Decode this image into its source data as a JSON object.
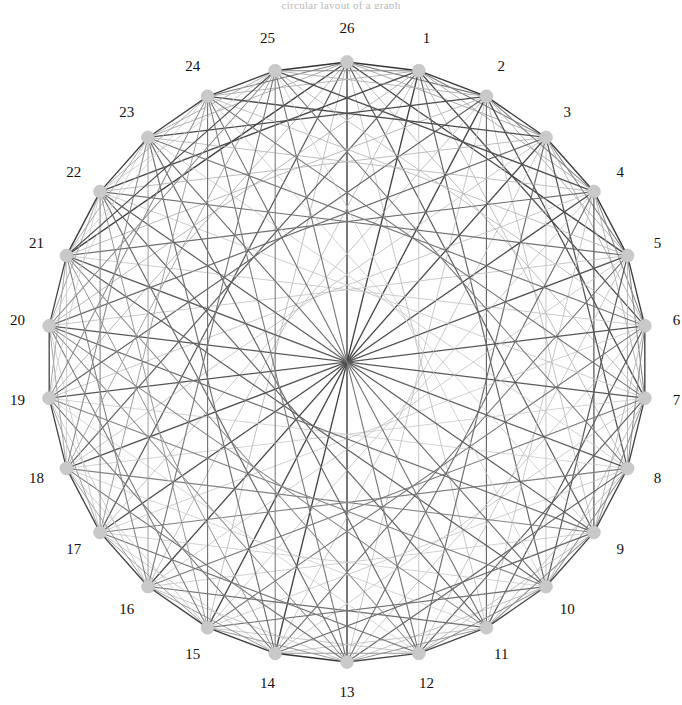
{
  "figure": {
    "type": "circular-graph",
    "title_strip": "circular layout of a graph",
    "background_color": "#ffffff",
    "node_count": 26,
    "center_x": 347,
    "center_y": 362,
    "radius": 300,
    "label_radius": 332,
    "start_angle_deg": -90,
    "direction": "clockwise",
    "node_marker": {
      "shape": "circle",
      "radius": 6.5,
      "fill": "#c9c9c9",
      "stroke": "#bdbdbd"
    },
    "label_style": {
      "font_size": 15,
      "color": "#111111"
    }
  },
  "chart_data": {
    "type": "graph",
    "title": "",
    "xlabel": "",
    "ylabel": "",
    "layout": "circular",
    "grid": false,
    "legend": "none",
    "nodes": [
      {
        "id": 1,
        "label": "1"
      },
      {
        "id": 2,
        "label": "2"
      },
      {
        "id": 3,
        "label": "3"
      },
      {
        "id": 4,
        "label": "4"
      },
      {
        "id": 5,
        "label": "5"
      },
      {
        "id": 6,
        "label": "6"
      },
      {
        "id": 7,
        "label": "7"
      },
      {
        "id": 8,
        "label": "8"
      },
      {
        "id": 9,
        "label": "9"
      },
      {
        "id": 10,
        "label": "10"
      },
      {
        "id": 11,
        "label": "11"
      },
      {
        "id": 12,
        "label": "12"
      },
      {
        "id": 13,
        "label": "13"
      },
      {
        "id": 14,
        "label": "14"
      },
      {
        "id": 15,
        "label": "15"
      },
      {
        "id": 16,
        "label": "16"
      },
      {
        "id": 17,
        "label": "17"
      },
      {
        "id": 18,
        "label": "18"
      },
      {
        "id": 19,
        "label": "19"
      },
      {
        "id": 20,
        "label": "20"
      },
      {
        "id": 21,
        "label": "21"
      },
      {
        "id": 22,
        "label": "22"
      },
      {
        "id": 23,
        "label": "23"
      },
      {
        "id": 24,
        "label": "24"
      },
      {
        "id": 25,
        "label": "25"
      },
      {
        "id": 26,
        "label": "26"
      }
    ],
    "edge_color_dark": "#2b2b2b",
    "edge_color_light": "#d8d8d8",
    "edge_weight_range": [
      0.08,
      1.0
    ],
    "edges": [
      {
        "s": 26,
        "t": 1,
        "w": 0.95
      },
      {
        "s": 26,
        "t": 2,
        "w": 0.55
      },
      {
        "s": 26,
        "t": 3,
        "w": 0.3
      },
      {
        "s": 26,
        "t": 5,
        "w": 0.85
      },
      {
        "s": 26,
        "t": 7,
        "w": 0.22
      },
      {
        "s": 26,
        "t": 9,
        "w": 0.7
      },
      {
        "s": 26,
        "t": 11,
        "w": 0.18
      },
      {
        "s": 26,
        "t": 13,
        "w": 0.9
      },
      {
        "s": 26,
        "t": 15,
        "w": 0.2
      },
      {
        "s": 26,
        "t": 17,
        "w": 0.72
      },
      {
        "s": 26,
        "t": 19,
        "w": 0.25
      },
      {
        "s": 26,
        "t": 21,
        "w": 0.88
      },
      {
        "s": 26,
        "t": 23,
        "w": 0.28
      },
      {
        "s": 26,
        "t": 24,
        "w": 0.5
      },
      {
        "s": 26,
        "t": 25,
        "w": 0.96
      },
      {
        "s": 1,
        "t": 2,
        "w": 0.93
      },
      {
        "s": 1,
        "t": 3,
        "w": 0.52
      },
      {
        "s": 1,
        "t": 4,
        "w": 0.28
      },
      {
        "s": 1,
        "t": 6,
        "w": 0.8
      },
      {
        "s": 1,
        "t": 8,
        "w": 0.2
      },
      {
        "s": 1,
        "t": 10,
        "w": 0.66
      },
      {
        "s": 1,
        "t": 12,
        "w": 0.17
      },
      {
        "s": 1,
        "t": 14,
        "w": 0.86
      },
      {
        "s": 1,
        "t": 16,
        "w": 0.19
      },
      {
        "s": 1,
        "t": 18,
        "w": 0.68
      },
      {
        "s": 1,
        "t": 20,
        "w": 0.24
      },
      {
        "s": 1,
        "t": 22,
        "w": 0.84
      },
      {
        "s": 1,
        "t": 24,
        "w": 0.26
      },
      {
        "s": 1,
        "t": 25,
        "w": 0.48
      },
      {
        "s": 2,
        "t": 3,
        "w": 0.92
      },
      {
        "s": 2,
        "t": 4,
        "w": 0.5
      },
      {
        "s": 2,
        "t": 5,
        "w": 0.27
      },
      {
        "s": 2,
        "t": 7,
        "w": 0.78
      },
      {
        "s": 2,
        "t": 9,
        "w": 0.19
      },
      {
        "s": 2,
        "t": 11,
        "w": 0.64
      },
      {
        "s": 2,
        "t": 13,
        "w": 0.16
      },
      {
        "s": 2,
        "t": 15,
        "w": 0.84
      },
      {
        "s": 2,
        "t": 17,
        "w": 0.18
      },
      {
        "s": 2,
        "t": 19,
        "w": 0.66
      },
      {
        "s": 2,
        "t": 21,
        "w": 0.23
      },
      {
        "s": 2,
        "t": 23,
        "w": 0.82
      },
      {
        "s": 2,
        "t": 25,
        "w": 0.25
      },
      {
        "s": 3,
        "t": 4,
        "w": 0.91
      },
      {
        "s": 3,
        "t": 5,
        "w": 0.49
      },
      {
        "s": 3,
        "t": 6,
        "w": 0.26
      },
      {
        "s": 3,
        "t": 8,
        "w": 0.76
      },
      {
        "s": 3,
        "t": 10,
        "w": 0.18
      },
      {
        "s": 3,
        "t": 12,
        "w": 0.62
      },
      {
        "s": 3,
        "t": 14,
        "w": 0.15
      },
      {
        "s": 3,
        "t": 16,
        "w": 0.82
      },
      {
        "s": 3,
        "t": 18,
        "w": 0.17
      },
      {
        "s": 3,
        "t": 20,
        "w": 0.64
      },
      {
        "s": 3,
        "t": 22,
        "w": 0.22
      },
      {
        "s": 3,
        "t": 24,
        "w": 0.8
      },
      {
        "s": 4,
        "t": 5,
        "w": 0.9
      },
      {
        "s": 4,
        "t": 6,
        "w": 0.47
      },
      {
        "s": 4,
        "t": 7,
        "w": 0.25
      },
      {
        "s": 4,
        "t": 9,
        "w": 0.74
      },
      {
        "s": 4,
        "t": 11,
        "w": 0.17
      },
      {
        "s": 4,
        "t": 13,
        "w": 0.6
      },
      {
        "s": 4,
        "t": 15,
        "w": 0.14
      },
      {
        "s": 4,
        "t": 17,
        "w": 0.8
      },
      {
        "s": 4,
        "t": 19,
        "w": 0.16
      },
      {
        "s": 4,
        "t": 21,
        "w": 0.62
      },
      {
        "s": 4,
        "t": 23,
        "w": 0.21
      },
      {
        "s": 4,
        "t": 25,
        "w": 0.78
      },
      {
        "s": 5,
        "t": 6,
        "w": 0.89
      },
      {
        "s": 5,
        "t": 7,
        "w": 0.46
      },
      {
        "s": 5,
        "t": 8,
        "w": 0.24
      },
      {
        "s": 5,
        "t": 10,
        "w": 0.72
      },
      {
        "s": 5,
        "t": 12,
        "w": 0.16
      },
      {
        "s": 5,
        "t": 14,
        "w": 0.58
      },
      {
        "s": 5,
        "t": 16,
        "w": 0.13
      },
      {
        "s": 5,
        "t": 18,
        "w": 0.78
      },
      {
        "s": 5,
        "t": 20,
        "w": 0.15
      },
      {
        "s": 5,
        "t": 22,
        "w": 0.6
      },
      {
        "s": 5,
        "t": 24,
        "w": 0.2
      },
      {
        "s": 6,
        "t": 7,
        "w": 0.88
      },
      {
        "s": 6,
        "t": 8,
        "w": 0.45
      },
      {
        "s": 6,
        "t": 9,
        "w": 0.23
      },
      {
        "s": 6,
        "t": 11,
        "w": 0.7
      },
      {
        "s": 6,
        "t": 13,
        "w": 0.15
      },
      {
        "s": 6,
        "t": 15,
        "w": 0.56
      },
      {
        "s": 6,
        "t": 17,
        "w": 0.12
      },
      {
        "s": 6,
        "t": 19,
        "w": 0.76
      },
      {
        "s": 6,
        "t": 21,
        "w": 0.14
      },
      {
        "s": 6,
        "t": 23,
        "w": 0.58
      },
      {
        "s": 6,
        "t": 25,
        "w": 0.19
      },
      {
        "s": 7,
        "t": 8,
        "w": 0.87
      },
      {
        "s": 7,
        "t": 9,
        "w": 0.44
      },
      {
        "s": 7,
        "t": 10,
        "w": 0.22
      },
      {
        "s": 7,
        "t": 12,
        "w": 0.68
      },
      {
        "s": 7,
        "t": 14,
        "w": 0.14
      },
      {
        "s": 7,
        "t": 16,
        "w": 0.54
      },
      {
        "s": 7,
        "t": 18,
        "w": 0.11
      },
      {
        "s": 7,
        "t": 20,
        "w": 0.74
      },
      {
        "s": 7,
        "t": 22,
        "w": 0.13
      },
      {
        "s": 7,
        "t": 24,
        "w": 0.56
      },
      {
        "s": 8,
        "t": 9,
        "w": 0.86
      },
      {
        "s": 8,
        "t": 10,
        "w": 0.43
      },
      {
        "s": 8,
        "t": 11,
        "w": 0.21
      },
      {
        "s": 8,
        "t": 13,
        "w": 0.66
      },
      {
        "s": 8,
        "t": 15,
        "w": 0.13
      },
      {
        "s": 8,
        "t": 17,
        "w": 0.52
      },
      {
        "s": 8,
        "t": 19,
        "w": 0.1
      },
      {
        "s": 8,
        "t": 21,
        "w": 0.72
      },
      {
        "s": 8,
        "t": 23,
        "w": 0.12
      },
      {
        "s": 8,
        "t": 25,
        "w": 0.54
      },
      {
        "s": 9,
        "t": 10,
        "w": 0.85
      },
      {
        "s": 9,
        "t": 11,
        "w": 0.42
      },
      {
        "s": 9,
        "t": 12,
        "w": 0.2
      },
      {
        "s": 9,
        "t": 14,
        "w": 0.64
      },
      {
        "s": 9,
        "t": 16,
        "w": 0.12
      },
      {
        "s": 9,
        "t": 18,
        "w": 0.5
      },
      {
        "s": 9,
        "t": 20,
        "w": 0.62
      },
      {
        "s": 9,
        "t": 22,
        "w": 0.7
      },
      {
        "s": 9,
        "t": 24,
        "w": 0.11
      },
      {
        "s": 10,
        "t": 11,
        "w": 0.84
      },
      {
        "s": 10,
        "t": 12,
        "w": 0.41
      },
      {
        "s": 10,
        "t": 13,
        "w": 0.19
      },
      {
        "s": 10,
        "t": 15,
        "w": 0.62
      },
      {
        "s": 10,
        "t": 17,
        "w": 0.11
      },
      {
        "s": 10,
        "t": 19,
        "w": 0.48
      },
      {
        "s": 10,
        "t": 21,
        "w": 0.68
      },
      {
        "s": 10,
        "t": 23,
        "w": 0.6
      },
      {
        "s": 10,
        "t": 25,
        "w": 0.1
      },
      {
        "s": 11,
        "t": 12,
        "w": 0.83
      },
      {
        "s": 11,
        "t": 13,
        "w": 0.4
      },
      {
        "s": 11,
        "t": 14,
        "w": 0.18
      },
      {
        "s": 11,
        "t": 16,
        "w": 0.6
      },
      {
        "s": 11,
        "t": 18,
        "w": 0.1
      },
      {
        "s": 11,
        "t": 20,
        "w": 0.46
      },
      {
        "s": 11,
        "t": 22,
        "w": 0.66
      },
      {
        "s": 11,
        "t": 24,
        "w": 0.58
      },
      {
        "s": 12,
        "t": 13,
        "w": 0.82
      },
      {
        "s": 12,
        "t": 14,
        "w": 0.39
      },
      {
        "s": 12,
        "t": 15,
        "w": 0.17
      },
      {
        "s": 12,
        "t": 17,
        "w": 0.58
      },
      {
        "s": 12,
        "t": 19,
        "w": 0.09
      },
      {
        "s": 12,
        "t": 21,
        "w": 0.44
      },
      {
        "s": 12,
        "t": 23,
        "w": 0.64
      },
      {
        "s": 12,
        "t": 25,
        "w": 0.56
      },
      {
        "s": 13,
        "t": 14,
        "w": 0.95
      },
      {
        "s": 13,
        "t": 15,
        "w": 0.38
      },
      {
        "s": 13,
        "t": 16,
        "w": 0.16
      },
      {
        "s": 13,
        "t": 18,
        "w": 0.56
      },
      {
        "s": 13,
        "t": 20,
        "w": 0.42
      },
      {
        "s": 13,
        "t": 22,
        "w": 0.62
      },
      {
        "s": 13,
        "t": 24,
        "w": 0.54
      },
      {
        "s": 14,
        "t": 15,
        "w": 0.9
      },
      {
        "s": 14,
        "t": 16,
        "w": 0.37
      },
      {
        "s": 14,
        "t": 17,
        "w": 0.15
      },
      {
        "s": 14,
        "t": 19,
        "w": 0.54
      },
      {
        "s": 14,
        "t": 21,
        "w": 0.4
      },
      {
        "s": 14,
        "t": 23,
        "w": 0.6
      },
      {
        "s": 14,
        "t": 25,
        "w": 0.52
      },
      {
        "s": 15,
        "t": 16,
        "w": 0.88
      },
      {
        "s": 15,
        "t": 17,
        "w": 0.36
      },
      {
        "s": 15,
        "t": 18,
        "w": 0.14
      },
      {
        "s": 15,
        "t": 20,
        "w": 0.52
      },
      {
        "s": 15,
        "t": 22,
        "w": 0.38
      },
      {
        "s": 15,
        "t": 24,
        "w": 0.58
      },
      {
        "s": 16,
        "t": 17,
        "w": 0.87
      },
      {
        "s": 16,
        "t": 18,
        "w": 0.35
      },
      {
        "s": 16,
        "t": 19,
        "w": 0.13
      },
      {
        "s": 16,
        "t": 21,
        "w": 0.5
      },
      {
        "s": 16,
        "t": 23,
        "w": 0.36
      },
      {
        "s": 16,
        "t": 25,
        "w": 0.56
      },
      {
        "s": 17,
        "t": 18,
        "w": 0.86
      },
      {
        "s": 17,
        "t": 19,
        "w": 0.34
      },
      {
        "s": 17,
        "t": 20,
        "w": 0.12
      },
      {
        "s": 17,
        "t": 22,
        "w": 0.48
      },
      {
        "s": 17,
        "t": 24,
        "w": 0.34
      },
      {
        "s": 18,
        "t": 19,
        "w": 0.85
      },
      {
        "s": 18,
        "t": 20,
        "w": 0.33
      },
      {
        "s": 18,
        "t": 21,
        "w": 0.11
      },
      {
        "s": 18,
        "t": 23,
        "w": 0.46
      },
      {
        "s": 18,
        "t": 25,
        "w": 0.32
      },
      {
        "s": 19,
        "t": 20,
        "w": 0.84
      },
      {
        "s": 19,
        "t": 21,
        "w": 0.32
      },
      {
        "s": 19,
        "t": 22,
        "w": 0.1
      },
      {
        "s": 19,
        "t": 24,
        "w": 0.44
      },
      {
        "s": 20,
        "t": 21,
        "w": 0.83
      },
      {
        "s": 20,
        "t": 22,
        "w": 0.31
      },
      {
        "s": 20,
        "t": 23,
        "w": 0.09
      },
      {
        "s": 20,
        "t": 25,
        "w": 0.42
      },
      {
        "s": 21,
        "t": 22,
        "w": 0.9
      },
      {
        "s": 21,
        "t": 23,
        "w": 0.3
      },
      {
        "s": 21,
        "t": 24,
        "w": 0.08
      },
      {
        "s": 21,
        "t": 25,
        "w": 0.78
      },
      {
        "s": 22,
        "t": 23,
        "w": 0.88
      },
      {
        "s": 22,
        "t": 24,
        "w": 0.29
      },
      {
        "s": 22,
        "t": 25,
        "w": 0.12
      },
      {
        "s": 23,
        "t": 24,
        "w": 0.86
      },
      {
        "s": 23,
        "t": 25,
        "w": 0.28
      },
      {
        "s": 24,
        "t": 25,
        "w": 0.85
      }
    ]
  }
}
